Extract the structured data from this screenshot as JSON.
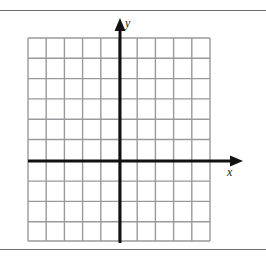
{
  "figure": {
    "kind": "cartesian-coordinate-grid",
    "width": 266,
    "height": 260,
    "background_color": "#ffffff"
  },
  "rules": {
    "top_rule_y": 10,
    "bottom_rule_y": 249,
    "color": "#6e6e72",
    "thickness": 1
  },
  "grid": {
    "color": "#9a9a9e",
    "line_width": 1.4,
    "left": 28,
    "right": 210,
    "top": 38,
    "bottom": 241,
    "vertical_lines": [
      28,
      46.2,
      64.4,
      82.6,
      100.8,
      119,
      137.2,
      155.4,
      173.6,
      191.8,
      210
    ],
    "horizontal_lines": [
      38,
      58.3,
      78.6,
      98.9,
      119.2,
      139.5,
      160.8,
      181.1,
      201.4,
      221.7,
      241
    ],
    "columns": 10,
    "rows": 10
  },
  "axes": {
    "color": "#111111",
    "line_width": 3,
    "origin_x": 120,
    "origin_y": 161,
    "x_axis": {
      "start_x": 28,
      "end_x": 243,
      "y": 161,
      "arrow": "right",
      "units_left_of_origin": 5,
      "units_right_of_origin": 5,
      "label": "x"
    },
    "y_axis": {
      "x": 120,
      "start_y": 243,
      "end_y": 18,
      "arrow": "up",
      "units_above_origin": 6,
      "units_below_origin": 4,
      "label": "y"
    }
  },
  "labels": {
    "y_label": "y",
    "x_label": "x"
  },
  "chart_data": {
    "type": "scatter",
    "title": "",
    "xlabel": "x",
    "ylabel": "y",
    "xlim": [
      -5,
      5
    ],
    "ylim": [
      -4,
      6
    ],
    "grid": true,
    "x_tick_step": 1,
    "y_tick_step": 1,
    "xticks": [
      -5,
      -4,
      -3,
      -2,
      -1,
      0,
      1,
      2,
      3,
      4,
      5
    ],
    "yticks": [
      -4,
      -3,
      -2,
      -1,
      0,
      1,
      2,
      3,
      4,
      5,
      6
    ],
    "tick_labels_shown": false,
    "series": [],
    "x": [],
    "values": [],
    "legend": [],
    "annotations": []
  }
}
